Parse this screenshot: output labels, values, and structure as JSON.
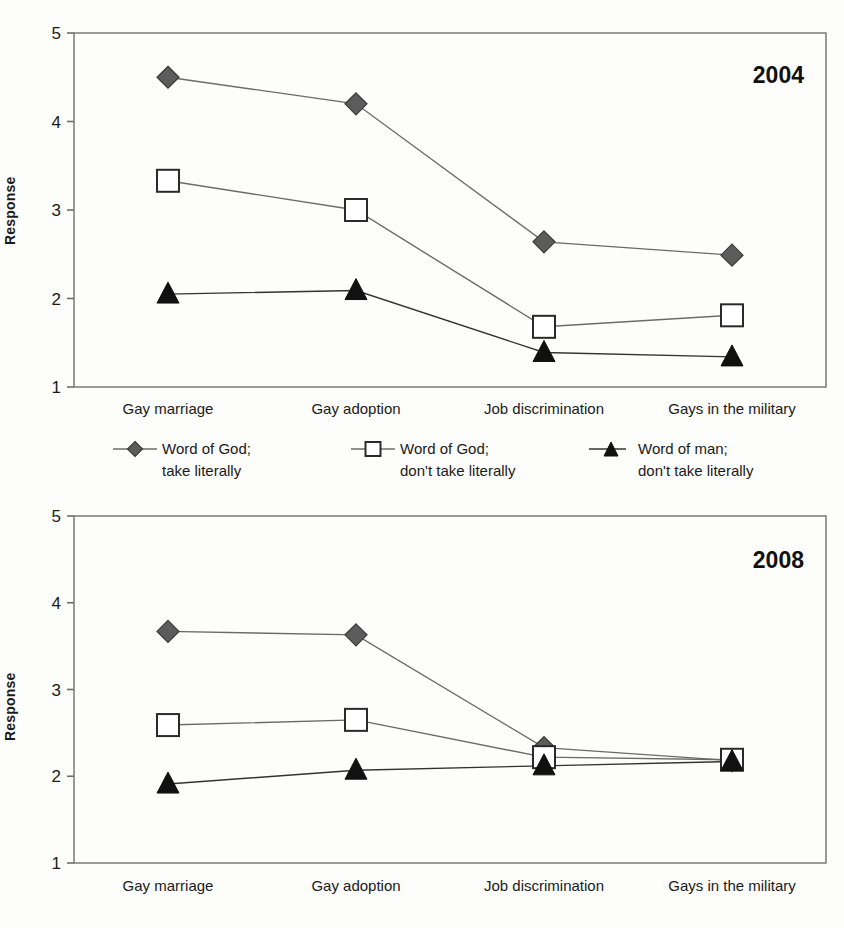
{
  "figure": {
    "ylabel": "Response",
    "categories": [
      "Gay marriage",
      "Gay adoption",
      "Job discrimination",
      "Gays in the military"
    ],
    "yticks": [
      "1",
      "2",
      "3",
      "4",
      "5"
    ],
    "panel_titles": [
      "2004",
      "2008"
    ]
  },
  "legend": {
    "items": [
      {
        "marker": "diamond-marker",
        "line1": "Word of God;",
        "line2": "take literally"
      },
      {
        "marker": "square-marker",
        "line1": "Word of God;",
        "line2": "don't take literally"
      },
      {
        "marker": "triangle-marker",
        "line1": "Word of man;",
        "line2": "don't take literally"
      }
    ]
  },
  "colors": {
    "diamond": "#5c5c5c",
    "square_fill": "#ffffff",
    "square_stroke": "#2a2a2a",
    "triangle": "#111111",
    "line": "#6b6b6b",
    "frame": "#7a7a7a",
    "background": "#fdfdfb"
  },
  "chart_data": [
    {
      "type": "line",
      "title": "2004",
      "xlabel": "",
      "ylabel": "Response",
      "ylim": [
        1,
        5
      ],
      "yticks": [
        1,
        2,
        3,
        4,
        5
      ],
      "grid": false,
      "legend_position": "below-panel",
      "categories": [
        "Gay marriage",
        "Gay adoption",
        "Job discrimination",
        "Gays in the military"
      ],
      "series": [
        {
          "name": "Word of God; take literally",
          "marker": "diamond",
          "values": [
            4.5,
            4.2,
            2.64,
            2.49
          ]
        },
        {
          "name": "Word of God; don't take literally",
          "marker": "square",
          "values": [
            3.33,
            3.0,
            1.68,
            1.81
          ]
        },
        {
          "name": "Word of man; don't take literally",
          "marker": "triangle",
          "values": [
            2.05,
            2.09,
            1.39,
            1.34
          ]
        }
      ]
    },
    {
      "type": "line",
      "title": "2008",
      "xlabel": "",
      "ylabel": "Response",
      "ylim": [
        1,
        5
      ],
      "yticks": [
        1,
        2,
        3,
        4,
        5
      ],
      "grid": false,
      "legend_position": "shared-above",
      "categories": [
        "Gay marriage",
        "Gay adoption",
        "Job discrimination",
        "Gays in the military"
      ],
      "series": [
        {
          "name": "Word of God; take literally",
          "marker": "diamond",
          "values": [
            3.67,
            3.63,
            2.33,
            2.18
          ]
        },
        {
          "name": "Word of God; don't take literally",
          "marker": "square",
          "values": [
            2.59,
            2.65,
            2.22,
            2.19
          ]
        },
        {
          "name": "Word of man; don't take literally",
          "marker": "triangle",
          "values": [
            1.91,
            2.07,
            2.12,
            2.17
          ]
        }
      ]
    }
  ]
}
